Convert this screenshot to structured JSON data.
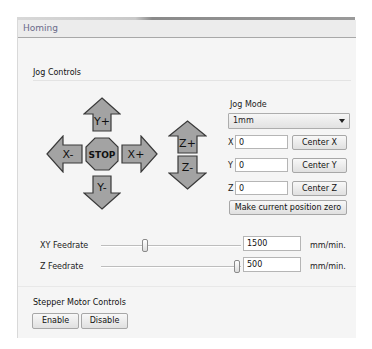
{
  "panel": {
    "title": "Homing"
  },
  "jog": {
    "group_title": "Jog Controls",
    "buttons": {
      "y_plus": "Y+",
      "y_minus": "Y-",
      "x_minus": "X-",
      "x_plus": "X+",
      "stop": "STOP",
      "z_plus": "Z+",
      "z_minus": "Z-"
    },
    "arrow_fill": "#a3a3a3",
    "arrow_stroke": "#3a3a3a",
    "mode_label": "Jog Mode",
    "mode_value": "1mm",
    "axes": [
      {
        "label": "X",
        "value": "0",
        "button": "Center X"
      },
      {
        "label": "Y",
        "value": "0",
        "button": "Center Y"
      },
      {
        "label": "Z",
        "value": "0",
        "button": "Center Z"
      }
    ],
    "zero_button": "Make current position zero"
  },
  "feedrates": [
    {
      "label": "XY Feedrate",
      "value": "1500",
      "unit": "mm/min."
    },
    {
      "label": "Z Feedrate",
      "value": "500",
      "unit": "mm/min."
    }
  ],
  "stepper": {
    "group_title": "Stepper Motor Controls",
    "enable": "Enable",
    "disable": "Disable"
  }
}
